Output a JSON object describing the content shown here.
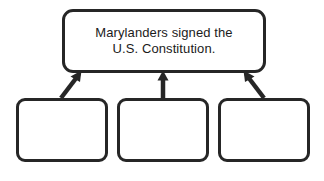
{
  "diagram": {
    "type": "supporting-details-organizer",
    "background_color": "#ffffff",
    "stroke_color": "#262626",
    "text_color": "#1b1b1b",
    "main_idea": {
      "label": "Marylanders signed the\nU.S. Constitution.",
      "line_1": "Marylanders signed the",
      "line_2": "U.S. Constitution."
    },
    "supporting_boxes": [
      {
        "label": ""
      },
      {
        "label": ""
      },
      {
        "label": ""
      }
    ],
    "connectors": [
      {
        "name": "arrow-left",
        "direction": "up-right",
        "from": "child-node-1",
        "to": "top-node"
      },
      {
        "name": "arrow-middle",
        "direction": "up",
        "from": "child-node-2",
        "to": "top-node"
      },
      {
        "name": "arrow-right",
        "direction": "up-left",
        "from": "child-node-3",
        "to": "top-node"
      }
    ]
  }
}
